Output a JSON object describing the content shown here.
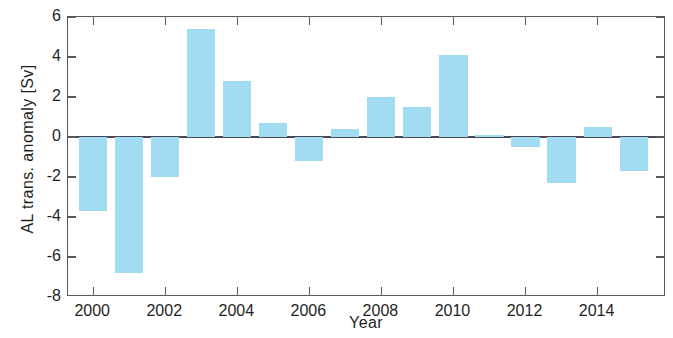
{
  "chart_data": {
    "type": "bar",
    "title": "",
    "xlabel": "Year",
    "ylabel": "AL trans. anomaly [Sv]",
    "xlim": [
      1999.3,
      2015.9
    ],
    "ylim": [
      -8,
      6
    ],
    "grid": false,
    "legend": null,
    "bar_color": "#a2dcf2",
    "axis_color": "#5a5a5a",
    "zero_line_color": "#4a4a56",
    "yticks": [
      6,
      4,
      2,
      0,
      -2,
      -4,
      -6,
      -8
    ],
    "ytick_labels": [
      "6",
      "4",
      "2",
      "0",
      "-2",
      "-4",
      "-6",
      "-8"
    ],
    "xticks": [
      2000,
      2002,
      2004,
      2006,
      2008,
      2010,
      2012,
      2014
    ],
    "xtick_labels": [
      "2000",
      "2002",
      "2004",
      "2006",
      "2008",
      "2010",
      "2012",
      "2014"
    ],
    "categories": [
      2000,
      2001,
      2002,
      2003,
      2004,
      2005,
      2006,
      2007,
      2008,
      2009,
      2010,
      2011,
      2012,
      2013,
      2014,
      2015
    ],
    "values": [
      -3.7,
      -6.8,
      -2.0,
      5.4,
      2.8,
      0.7,
      -1.2,
      0.4,
      2.0,
      1.5,
      4.1,
      0.1,
      -0.5,
      -2.3,
      0.5,
      -1.7
    ],
    "bar_width_years": 0.78
  },
  "figure": {
    "background": "#ffffff"
  }
}
